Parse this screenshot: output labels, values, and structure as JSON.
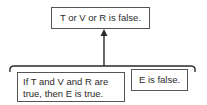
{
  "diagram": {
    "conclusion": "T or V or R is false.",
    "premises": [
      {
        "line1": "If T and V and R are",
        "line2": "true, then E is true."
      },
      {
        "text": "E is false."
      }
    ],
    "colors": {
      "stroke": "#2a2a2a",
      "border": "#555555",
      "background": "#ffffff"
    }
  }
}
